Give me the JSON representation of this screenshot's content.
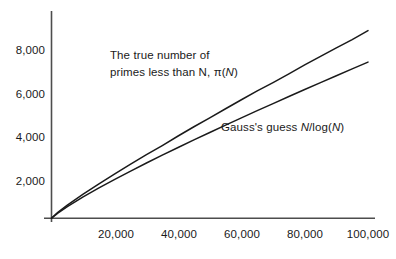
{
  "chart_data": {
    "type": "line",
    "title": "",
    "subtitle": "",
    "xlabel": "",
    "ylabel": "",
    "xlim": [
      0,
      105000
    ],
    "ylim": [
      0,
      9800
    ],
    "grid": false,
    "legend_position": "inline-annotations",
    "xticks": [
      20000,
      40000,
      60000,
      80000,
      100000
    ],
    "xtick_labels": [
      "20,000",
      "40,000",
      "60,000",
      "80,000",
      "100,000"
    ],
    "yticks": [
      2000,
      4000,
      6000,
      8000
    ],
    "ytick_labels": [
      "2,000",
      "4,000",
      "6,000",
      "8,000"
    ],
    "series": [
      {
        "name": "pi(N)",
        "label": "The true number of primes less than N, π(N)",
        "color": "#1a1a1a",
        "x": [
          0,
          2000,
          5000,
          10000,
          15000,
          20000,
          25000,
          30000,
          35000,
          40000,
          45000,
          50000,
          55000,
          60000,
          65000,
          70000,
          75000,
          80000,
          85000,
          90000,
          95000,
          100000
        ],
        "values": [
          0,
          303,
          669,
          1229,
          1754,
          2262,
          2762,
          3245,
          3713,
          4203,
          4675,
          5133,
          5597,
          6057,
          6510,
          6935,
          7378,
          7837,
          8275,
          8713,
          9132,
          9592
        ]
      },
      {
        "name": "N/log(N)",
        "label": "Gauss's guess N/log(N)",
        "color": "#1a1a1a",
        "x": [
          0,
          2000,
          5000,
          10000,
          15000,
          20000,
          25000,
          30000,
          35000,
          40000,
          45000,
          50000,
          55000,
          60000,
          65000,
          70000,
          75000,
          80000,
          85000,
          90000,
          95000,
          100000
        ],
        "values": [
          0,
          263,
          587,
          1086,
          1547,
          1986,
          2410,
          2821,
          3223,
          3617,
          4004,
          4384,
          4760,
          5131,
          5498,
          5861,
          6221,
          6578,
          6932,
          7283,
          7632,
          7979
        ]
      }
    ],
    "annotations": [
      {
        "id": "pi-annotation",
        "line1": "The true number of",
        "line2_pre": "primes less than N, ",
        "line2_pi": "π(",
        "line2_var": "N",
        "line2_post": ")"
      },
      {
        "id": "gauss-annotation",
        "pre": "Gauss's guess ",
        "var1": "N",
        "mid": "/log(",
        "var2": "N",
        "post": ")"
      }
    ],
    "axis_color": "#4d4d4d",
    "curve_color": "#1a1a1a",
    "background": "#ffffff"
  }
}
